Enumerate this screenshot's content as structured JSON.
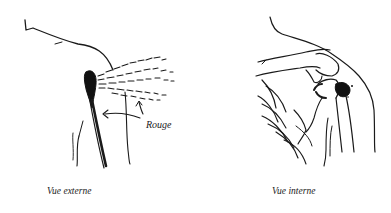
{
  "figure": {
    "panels": [
      {
        "id": "external",
        "caption": "Vue externe",
        "annotation": "Rouge"
      },
      {
        "id": "internal",
        "caption": "Vue interne"
      }
    ],
    "colors": {
      "ink": "#1a1a1a",
      "background": "#ffffff"
    }
  }
}
